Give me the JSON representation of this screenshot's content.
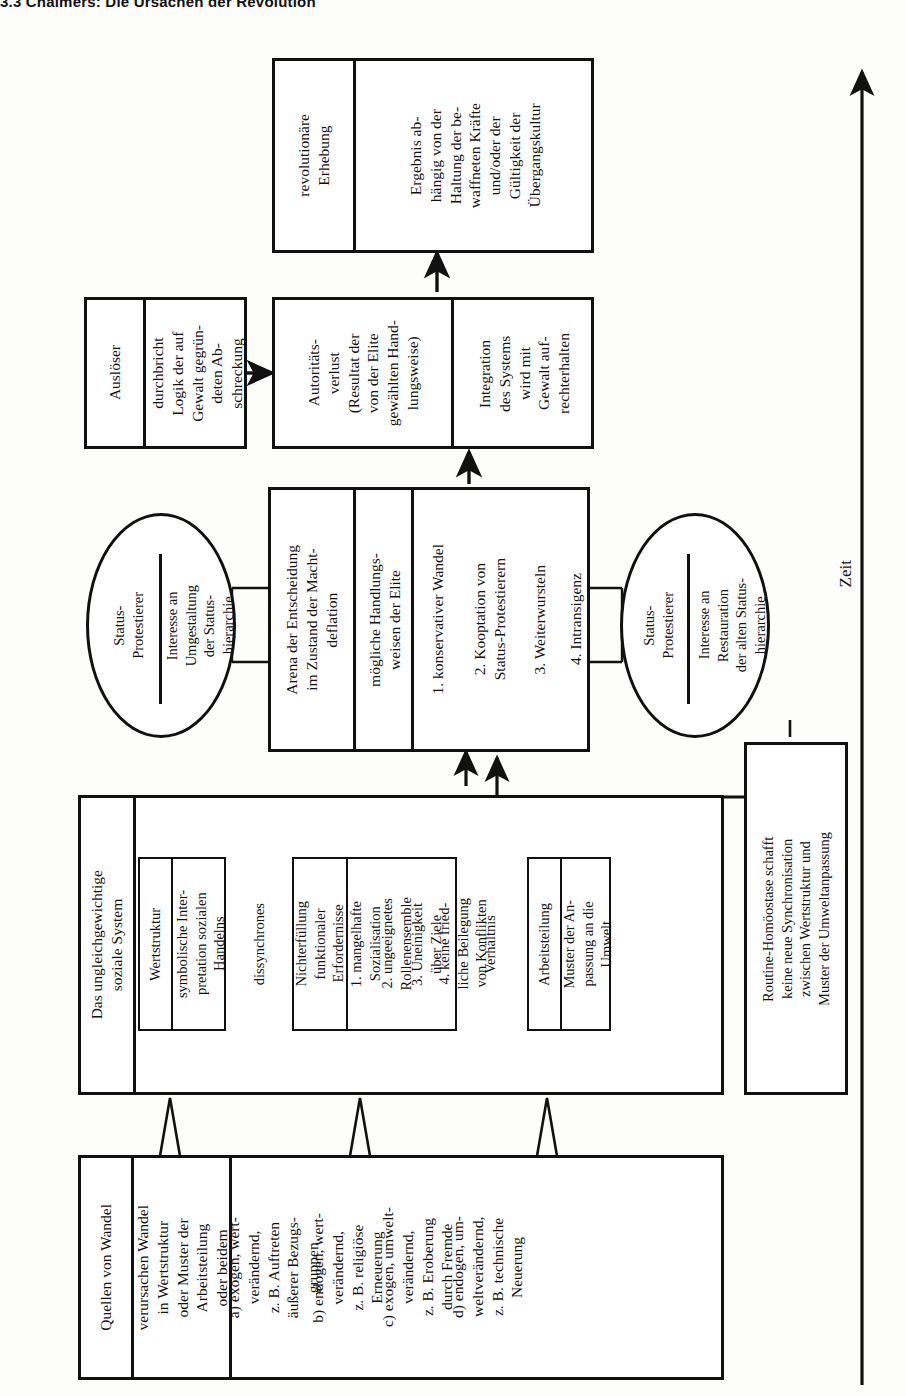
{
  "page": {
    "header": "3.3  Chalmers: Die Ursachen der Revolution"
  },
  "axis": {
    "label": "Zeit",
    "direction": "up-arrow"
  },
  "diagram": {
    "orientation": "rotated-90-ccw",
    "revolution_box": {
      "title": "revolutionäre\nErhebung",
      "body": "Ergebnis ab-\nhängig von der\nHaltung der be-\nwaffneten Kräfte\nund/oder der\nGültigkeit der\nÜbergangskultur"
    },
    "trigger_box": {
      "title": "Auslöser",
      "body": "durchbricht\nLogik der auf\nGewalt gegrün-\ndeten Ab-\nschreckung"
    },
    "authority_box": {
      "title": "Autoritäts-\nverlust\n(Resultat der\nvon der Elite\ngewählten Hand-\nlungsweise)",
      "body": "Integration\ndes Systems\nwird mit\nGewalt auf-\nrechterhalten"
    },
    "arena_box": {
      "title": "Arena der Entscheidung\nim Zustand der Macht-\ndeflation",
      "subtitle": "mögliche Handlungs-\nweisen der Elite",
      "options": [
        "1. konservativer Wandel",
        "2. Kooptation von\nStatus-Protestierern",
        "3. Weiterwursteln",
        "4. Intransigenz"
      ]
    },
    "circle_left": {
      "title": "Status-\nProtestierer",
      "body": "Interesse an\nUmgestaltung\nder Status-\nhierarchie"
    },
    "circle_right": {
      "title": "Status-\nProtestierer",
      "body": "Interesse an\nRestauration\nder alten Status-\nhierarchie"
    },
    "system_box": {
      "title": "Das ungleichgewichtige\nsoziale System",
      "value_structure": {
        "title": "Wertstruktur",
        "body": "symbolische Inter-\npretation sozialen\nHandelns"
      },
      "spring_label_1": "dissynchrones",
      "dysfunction": {
        "title": "Nichterfüllung\nfunktionaler\nErfordernisse",
        "items": [
          "1. mangelhafte\nSozialisation",
          "2. ungeeignetes\nRollenensemble",
          "3. Uneinigkeit\nüber Ziele",
          "4. keine fried-\nliche Beilegung\nvon Konflikten"
        ]
      },
      "spring_label_2": "Verhältnis",
      "division_of_labour": {
        "title": "Arbeitsteilung",
        "body": "Muster der An-\npassung an die\nUmwelt"
      }
    },
    "homeostasis_box": {
      "body": "Routine-Homöostase schafft\nkeine neue Synchronisation\nzwischen Wertstruktur und\nMuster der Umweltanpassung"
    },
    "sources_box": {
      "title": "Quellen von Wandel",
      "effect": "verursachen Wandel\nin Wertstruktur\noder Muster der\nArbeitsteilung\noder beidem",
      "items": [
        "a) exogen, wert-\nverändernd,\nz. B. Auftreten\näußerer Bezugs-\ngruppen",
        "b) endogen, wert-\nverändernd,\nz. B. religiöse\nErneuerung",
        "c) exogen, umwelt-\nverändernd,\nz. B. Eroberung\ndurch Fremde",
        "d) endogen, um-\nweltverändernd,\nz. B. technische\nNeuerung"
      ]
    }
  },
  "colors": {
    "ink": "#111111",
    "paper": "#fdfdfb"
  }
}
